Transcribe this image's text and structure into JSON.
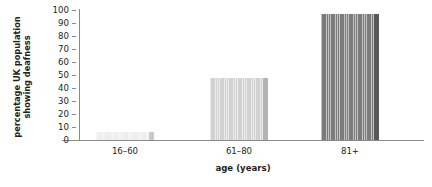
{
  "chart_data": {
    "type": "bar",
    "title": "",
    "xlabel": "age (years)",
    "ylabel": "percentage UK population showing deafness",
    "ylabel_line1": "percentage UK population",
    "ylabel_line2": "showing deafness",
    "categories": [
      "16–60",
      "61–80",
      "81+"
    ],
    "values": [
      6,
      48,
      97
    ],
    "ylim": [
      0,
      100
    ],
    "ytick_labels": [
      "100",
      "90",
      "80",
      "70",
      "60",
      "50",
      "40",
      "30",
      "20",
      "10",
      "0"
    ],
    "ytick_values": [
      100,
      90,
      80,
      70,
      60,
      50,
      40,
      30,
      20,
      10,
      0
    ],
    "ytick_step": 10,
    "grid": false,
    "legend": false,
    "series": [
      {
        "name": "percentage UK population showing deafness",
        "values": [
          6,
          48,
          97
        ]
      }
    ],
    "bar_colors": [
      "#ededed",
      "#d2d2d2",
      "#7b7b7b"
    ],
    "bar_edge_colors": [
      "#c9c9c9",
      "#b4b4b4",
      "#585858"
    ],
    "axis_color": "#8a8a8a",
    "text_color": "#231f20",
    "background": "#ffffff"
  }
}
